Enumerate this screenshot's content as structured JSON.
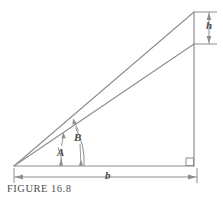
{
  "figure": {
    "caption": "FIGURE 16.8",
    "stroke_color": "#8d8d8d",
    "label_color": "#4a4a4a",
    "background": "#ffffff",
    "labels": {
      "angle_a": "A",
      "angle_b": "B",
      "base": "b",
      "height": "h"
    },
    "geometry": {
      "left_vertex": [
        14,
        166
      ],
      "top_apex": [
        194,
        12
      ],
      "right_base_vertex": [
        194,
        166
      ],
      "inner_line_end": [
        194,
        44
      ],
      "base_dimension_y": 177,
      "base_dimension_x_start": 14,
      "base_dimension_x_end": 197,
      "height_dimension_x": 201,
      "height_dimension_y_top": 12,
      "height_dimension_y_bottom": 44
    }
  }
}
